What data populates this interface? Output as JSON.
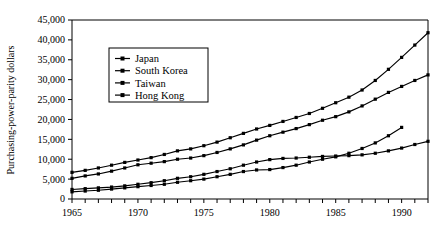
{
  "chart_data": {
    "type": "line",
    "title": "",
    "xlabel": "",
    "ylabel": "Purchasing-power-parity dollars",
    "xlim": [
      1965,
      1992
    ],
    "ylim": [
      0,
      45000
    ],
    "y_tick_step": 5000,
    "x_tick_step": 1,
    "x_label_step": 5,
    "grid": false,
    "legend_position": "upper-left-inset",
    "y_tick_labels": [
      "0",
      "5,000",
      "10,000",
      "15,000",
      "20,000",
      "25,000",
      "30,000",
      "35,000",
      "40,000",
      "45,000"
    ],
    "y_tick_values": [
      0,
      5000,
      10000,
      15000,
      20000,
      25000,
      30000,
      35000,
      40000,
      45000
    ],
    "x_tick_labels": [
      "1965",
      "1970",
      "1975",
      "1980",
      "1985",
      "1990"
    ],
    "x_tick_values": [
      1965,
      1970,
      1975,
      1980,
      1985,
      1990
    ],
    "x_minor_ticks": [
      1965,
      1966,
      1967,
      1968,
      1969,
      1970,
      1971,
      1972,
      1973,
      1974,
      1975,
      1976,
      1977,
      1978,
      1979,
      1980,
      1981,
      1982,
      1983,
      1984,
      1985,
      1986,
      1987,
      1988,
      1989,
      1990,
      1991,
      1992
    ],
    "marker": "square",
    "line_color": "#000000",
    "background_color": "#ffffff",
    "series": [
      {
        "name": "Japan",
        "x": [
          1965,
          1966,
          1967,
          1968,
          1969,
          1970,
          1971,
          1972,
          1973,
          1974,
          1975,
          1976,
          1977,
          1978,
          1979,
          1980,
          1981,
          1982,
          1983,
          1984,
          1985,
          1986,
          1987,
          1988,
          1989,
          1990,
          1991,
          1992
        ],
        "values": [
          6700,
          7200,
          7800,
          8500,
          9200,
          9800,
          10400,
          11200,
          12100,
          12600,
          13400,
          14300,
          15400,
          16500,
          17600,
          18500,
          19500,
          20500,
          21500,
          22800,
          24200,
          25600,
          27400,
          29800,
          32600,
          35600,
          38700,
          41800
        ]
      },
      {
        "name": "South Korea",
        "x": [
          1965,
          1966,
          1967,
          1968,
          1969,
          1970,
          1971,
          1972,
          1973,
          1974,
          1975,
          1976,
          1977,
          1978,
          1979,
          1980,
          1981,
          1982,
          1983,
          1984,
          1985,
          1986,
          1987,
          1988,
          1989,
          1990
        ],
        "values": [
          1800,
          2000,
          2200,
          2500,
          2800,
          3100,
          3400,
          3700,
          4200,
          4600,
          5000,
          5600,
          6200,
          6900,
          7300,
          7400,
          7900,
          8500,
          9300,
          10000,
          10600,
          11500,
          12700,
          14100,
          15900,
          18000
        ]
      },
      {
        "name": "Taiwan",
        "x": [
          1965,
          1966,
          1967,
          1968,
          1969,
          1970,
          1971,
          1972,
          1973,
          1974,
          1975,
          1976,
          1977,
          1978,
          1979,
          1980,
          1981,
          1982,
          1983,
          1984,
          1985,
          1986,
          1987,
          1988,
          1989,
          1990,
          1991,
          1992
        ],
        "values": [
          2400,
          2600,
          2800,
          3000,
          3300,
          3700,
          4100,
          4600,
          5200,
          5600,
          6200,
          6900,
          7600,
          8500,
          9300,
          9900,
          10200,
          10300,
          10500,
          10700,
          10800,
          10900,
          11100,
          11500,
          12100,
          12800,
          13700,
          14500
        ]
      },
      {
        "name": "Hong Kong",
        "x": [
          1965,
          1966,
          1967,
          1968,
          1969,
          1970,
          1971,
          1972,
          1973,
          1974,
          1975,
          1976,
          1977,
          1978,
          1979,
          1980,
          1981,
          1982,
          1983,
          1984,
          1985,
          1986,
          1987,
          1988,
          1989,
          1990,
          1991,
          1992
        ],
        "values": [
          5200,
          5800,
          6300,
          7000,
          7800,
          8600,
          9000,
          9400,
          10000,
          10300,
          10900,
          11700,
          12600,
          13600,
          14800,
          15900,
          16800,
          17700,
          18700,
          19800,
          20700,
          21900,
          23400,
          25100,
          26800,
          28300,
          29800,
          31200
        ]
      }
    ]
  },
  "legend": {
    "entries": [
      {
        "label": "Japan"
      },
      {
        "label": "South Korea"
      },
      {
        "label": "Taiwan"
      },
      {
        "label": "Hong Kong"
      }
    ]
  }
}
